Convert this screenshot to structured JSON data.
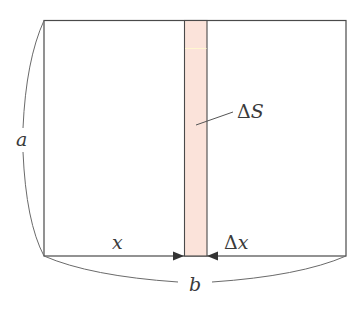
{
  "diagram": {
    "type": "area-element-rectangle",
    "colors": {
      "stroke": "#4a4a4a",
      "brace": "#6a6a6a",
      "strip_fill": "#fbe3da",
      "strip_highlight": "#fff6d0",
      "background": "#ffffff"
    },
    "labels": {
      "height": "a",
      "width": "b",
      "position": "x",
      "delta_symbol": "Δ",
      "delta_x_var": "x",
      "delta_s_var": "S"
    },
    "caption": ""
  }
}
